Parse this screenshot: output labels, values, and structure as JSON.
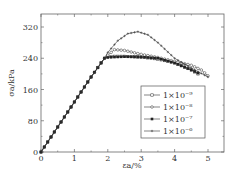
{
  "chart_data": {
    "type": "line",
    "title": "",
    "xlabel": "εa/%",
    "ylabel": "σa/kPa",
    "xlim": [
      0,
      5.5
    ],
    "ylim": [
      0,
      350
    ],
    "xticks": [
      0,
      1,
      2,
      3,
      4,
      5
    ],
    "yticks": [
      0,
      80,
      160,
      240,
      320
    ],
    "grid": false,
    "legend_position": "lower right (inside)",
    "series": [
      {
        "name": "1×10⁻⁹",
        "marker": "square-open",
        "x": [
          0,
          0.5,
          1,
          1.5,
          1.9,
          2.0,
          2.2,
          2.5,
          3.0,
          3.5,
          4.0,
          4.5,
          4.7
        ],
        "y": [
          0,
          64,
          128,
          192,
          240,
          244,
          245,
          245,
          243,
          238,
          228,
          210,
          200
        ]
      },
      {
        "name": "1×10⁻⁸",
        "marker": "circle-open",
        "x": [
          0,
          0.5,
          1,
          1.5,
          1.9,
          2.0,
          2.2,
          2.5,
          3.0,
          3.5,
          4.0,
          4.5,
          4.8,
          5.0
        ],
        "y": [
          0,
          64,
          128,
          192,
          240,
          248,
          262,
          260,
          250,
          242,
          232,
          222,
          210,
          195
        ]
      },
      {
        "name": "1×10⁻⁷",
        "marker": "square-filled",
        "x": [
          0,
          0.5,
          1,
          1.5,
          1.9,
          2.0,
          2.2,
          2.5,
          3.0,
          3.5,
          4.0,
          4.5,
          4.7
        ],
        "y": [
          0,
          64,
          128,
          192,
          240,
          242,
          243,
          244,
          243,
          240,
          228,
          210,
          202
        ]
      },
      {
        "name": "1×10⁻⁶",
        "marker": "plus",
        "x": [
          0,
          0.5,
          1,
          1.5,
          1.9,
          2.0,
          2.3,
          2.6,
          2.9,
          3.2,
          3.5,
          4.0,
          4.5,
          5.0
        ],
        "y": [
          0,
          64,
          128,
          192,
          240,
          255,
          285,
          303,
          308,
          300,
          280,
          240,
          215,
          192
        ]
      }
    ]
  },
  "legend": {
    "entries": [
      "1×10⁻⁹",
      "1×10⁻⁸",
      "1×10⁻⁷",
      "1×10⁻⁶"
    ]
  },
  "axes": {
    "xlabel": "εa/%",
    "ylabel": "σa/kPa",
    "xticks": [
      "0",
      "1",
      "2",
      "3",
      "4",
      "5"
    ],
    "yticks": [
      "0",
      "80",
      "160",
      "240",
      "320"
    ]
  }
}
